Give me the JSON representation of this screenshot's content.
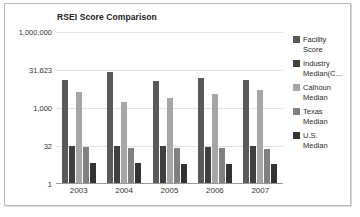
{
  "chart_data": {
    "type": "bar",
    "title": "RSEI Score Comparison",
    "xlabel": "",
    "ylabel": "",
    "categories": [
      "2003",
      "2004",
      "2005",
      "2006",
      "2007"
    ],
    "ytick_labels": [
      "1,000,000",
      "31,623",
      "1,000",
      "32",
      "1"
    ],
    "ytick_values": [
      1000000,
      31623,
      1000,
      32,
      1
    ],
    "yscale": "log",
    "ylim": [
      1,
      1000000
    ],
    "grid": true,
    "legend_position": "right",
    "series": [
      {
        "name": "Facility Score",
        "color": "#595959",
        "values": [
          13000,
          26000,
          12000,
          15000,
          13000
        ]
      },
      {
        "name": "Industry Median(C...",
        "color": "#3f3f3f",
        "values": [
          33,
          33,
          31,
          30,
          31
        ]
      },
      {
        "name": "Calhoun Median",
        "color": "#a6a6a6",
        "values": [
          4200,
          1700,
          2600,
          3600,
          5200
        ]
      },
      {
        "name": "Texas Median",
        "color": "#808080",
        "values": [
          28,
          27,
          27,
          27,
          24
        ]
      },
      {
        "name": "U.S. Median",
        "color": "#333333",
        "values": [
          7,
          7,
          6,
          6,
          6
        ]
      }
    ]
  },
  "legend": {
    "items": [
      {
        "label_line1": "Facility",
        "label_line2": "Score"
      },
      {
        "label_line1": "Industry",
        "label_line2": "Median(C..."
      },
      {
        "label_line1": "Calhoun",
        "label_line2": "Median"
      },
      {
        "label_line1": "Texas",
        "label_line2": "Median"
      },
      {
        "label_line1": "U.S.",
        "label_line2": "Median"
      }
    ]
  }
}
